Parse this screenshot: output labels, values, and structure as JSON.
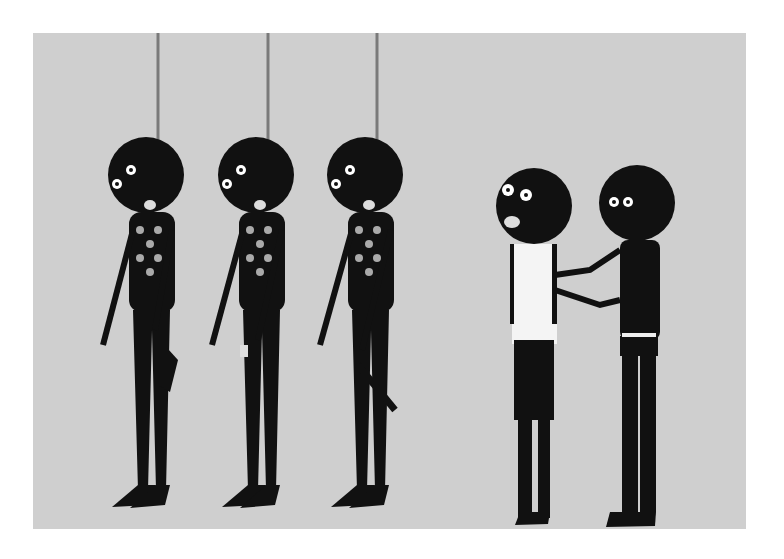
{
  "artwork": {
    "description": "Flat graphic illustration of five stylized black figures on a light grey background",
    "colors": {
      "background": "#cfcfcf",
      "frame": "#ffffff",
      "figure": "#111111",
      "rope": "#777777",
      "accent_white": "#f4f4f4"
    },
    "figures": [
      {
        "id": "hanging-1",
        "type": "hanging",
        "holds": "sneaker"
      },
      {
        "id": "hanging-2",
        "type": "hanging",
        "holds": "wristwatch"
      },
      {
        "id": "hanging-3",
        "type": "hanging",
        "holds": "severed arm"
      },
      {
        "id": "standing-white-tank",
        "type": "standing",
        "clothing": "white tank top",
        "expression": "frightened"
      },
      {
        "id": "standing-black",
        "type": "standing",
        "action": "holding other figure by shoulder"
      }
    ]
  }
}
